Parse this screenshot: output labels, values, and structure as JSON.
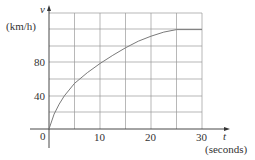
{
  "chart_data": {
    "type": "line",
    "title": "",
    "xlabel": "t (seconds)",
    "ylabel": "v (km/h)",
    "x_axis_symbol": "t",
    "x_axis_unit": "(seconds)",
    "y_axis_symbol": "v",
    "y_axis_unit": "(km/h)",
    "x_ticks": [
      "0",
      "10",
      "20",
      "30"
    ],
    "y_ticks": [
      "40",
      "80"
    ],
    "origin_label": "0",
    "xlim": [
      0,
      30
    ],
    "ylim": [
      0,
      140
    ],
    "grid": true,
    "grid_x_step": 5,
    "grid_y_step": 20,
    "series": [
      {
        "name": "velocity",
        "x": [
          0,
          1,
          2,
          3,
          5,
          7.5,
          10,
          12.5,
          15,
          17.5,
          20,
          22.5,
          25,
          30
        ],
        "y": [
          0,
          18,
          30,
          40,
          55,
          68,
          79,
          89,
          98,
          106,
          112,
          117,
          120,
          120
        ]
      }
    ]
  }
}
